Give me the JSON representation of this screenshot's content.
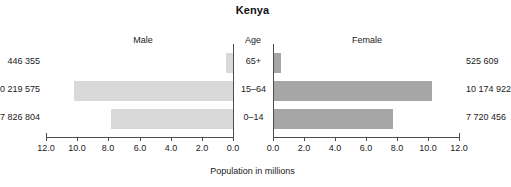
{
  "chart_data": {
    "type": "bar",
    "title": "Kenya",
    "subtype": "population-pyramid",
    "xlabel": "Population in millions",
    "ylabel": "Age",
    "categories": [
      "65+",
      "15–64",
      "0–14"
    ],
    "series": [
      {
        "name": "Male",
        "values": [
          0.446355,
          10.219575,
          7.826804
        ],
        "labels": [
          "446 355",
          "10 219 575",
          "7 826 804"
        ],
        "color": "#d9d9d9",
        "direction": "left"
      },
      {
        "name": "Female",
        "values": [
          0.525609,
          10.174922,
          7.720456
        ],
        "labels": [
          "525 609",
          "10 174 922",
          "7 720 456"
        ],
        "color": "#a6a6a6",
        "direction": "right"
      }
    ],
    "xlim": [
      0,
      12
    ],
    "left_axis_ticks": [
      "12.0",
      "10.0",
      "8.0",
      "6.0",
      "4.0",
      "2.0",
      "0.0"
    ],
    "right_axis_ticks": [
      "0.0",
      "2.0",
      "4.0",
      "6.0",
      "8.0",
      "10.0",
      "12.0"
    ],
    "grid": false,
    "legend": "none"
  },
  "headers": {
    "male": "Male",
    "age": "Age",
    "female": "Female"
  },
  "age_labels": {
    "senior": "65+",
    "adult": "15–64",
    "child": "0–14"
  },
  "male_values": {
    "senior": "446 355",
    "adult": "10 219 575",
    "child": "7 826 804"
  },
  "female_values": {
    "senior": "525 609",
    "adult": "10 174 922",
    "child": "7 720 456"
  },
  "axis": {
    "title": "Population in millions",
    "left_ticks": [
      "12.0",
      "10.0",
      "8.0",
      "6.0",
      "4.0",
      "2.0",
      "0.0"
    ],
    "right_ticks": [
      "0.0",
      "2.0",
      "4.0",
      "6.0",
      "8.0",
      "10.0",
      "12.0"
    ]
  },
  "colors": {
    "male_bar": "#d9d9d9",
    "female_bar": "#a6a6a6",
    "axis": "#4d4d4d",
    "background": "#ffffff"
  }
}
